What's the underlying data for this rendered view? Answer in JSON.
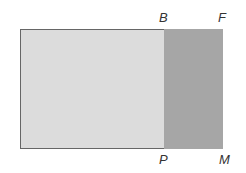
{
  "diagram": {
    "type": "geometric-rectangles",
    "shapes": [
      {
        "name": "light-rectangle",
        "fill": "#dcdcdc",
        "border": "#666666"
      },
      {
        "name": "shaded-rectangle BFMP",
        "fill": "#a6a6a6"
      }
    ],
    "labels": {
      "b": "B",
      "f": "F",
      "p": "P",
      "m": "M"
    }
  }
}
